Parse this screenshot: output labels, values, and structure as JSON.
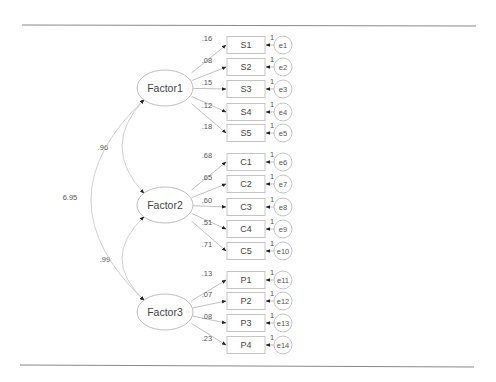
{
  "diagram": {
    "type": "structural-equation-model",
    "factors": [
      {
        "id": "Factor1",
        "label": "Factor1",
        "cx": 165,
        "cy": 88,
        "indicators": [
          {
            "label": "S1",
            "loading": ".16",
            "error": "e1",
            "fixed": "1",
            "y": 45
          },
          {
            "label": "S2",
            "loading": ".08",
            "error": "e2",
            "fixed": "1",
            "y": 67
          },
          {
            "label": "S3",
            "loading": ".15",
            "error": "e3",
            "fixed": "1",
            "y": 89
          },
          {
            "label": "S4",
            "loading": ".12",
            "error": "e4",
            "fixed": "1",
            "y": 112
          },
          {
            "label": "S5",
            "loading": ".18",
            "error": "e5",
            "fixed": "1",
            "y": 133
          }
        ]
      },
      {
        "id": "Factor2",
        "label": "Factor2",
        "cx": 165,
        "cy": 205,
        "indicators": [
          {
            "label": "C1",
            "loading": ".68",
            "error": "e6",
            "fixed": "1",
            "y": 162
          },
          {
            "label": "C2",
            "loading": ".65",
            "error": "e7",
            "fixed": "1",
            "y": 184
          },
          {
            "label": "C3",
            "loading": ".60",
            "error": "e8",
            "fixed": "1",
            "y": 207
          },
          {
            "label": "C4",
            "loading": ".51",
            "error": "e9",
            "fixed": "1",
            "y": 229
          },
          {
            "label": "C5",
            "loading": ".71",
            "error": "e10",
            "fixed": "1",
            "y": 251
          }
        ]
      },
      {
        "id": "Factor3",
        "label": "Factor3",
        "cx": 165,
        "cy": 312,
        "indicators": [
          {
            "label": "P1",
            "loading": ".13",
            "error": "e11",
            "fixed": "1",
            "y": 280
          },
          {
            "label": "P2",
            "loading": ".07",
            "error": "e12",
            "fixed": "1",
            "y": 301
          },
          {
            "label": "P3",
            "loading": ".08",
            "error": "e13",
            "fixed": "1",
            "y": 323
          },
          {
            "label": "P4",
            "loading": ".23",
            "error": "e14",
            "fixed": "1",
            "y": 345
          }
        ]
      }
    ],
    "covariances": [
      {
        "from": "Factor1",
        "to": "Factor2",
        "value": ".96"
      },
      {
        "from": "Factor2",
        "to": "Factor3",
        "value": ".99"
      },
      {
        "from": "Factor1",
        "to": "Factor3",
        "value": "6.95"
      }
    ]
  }
}
